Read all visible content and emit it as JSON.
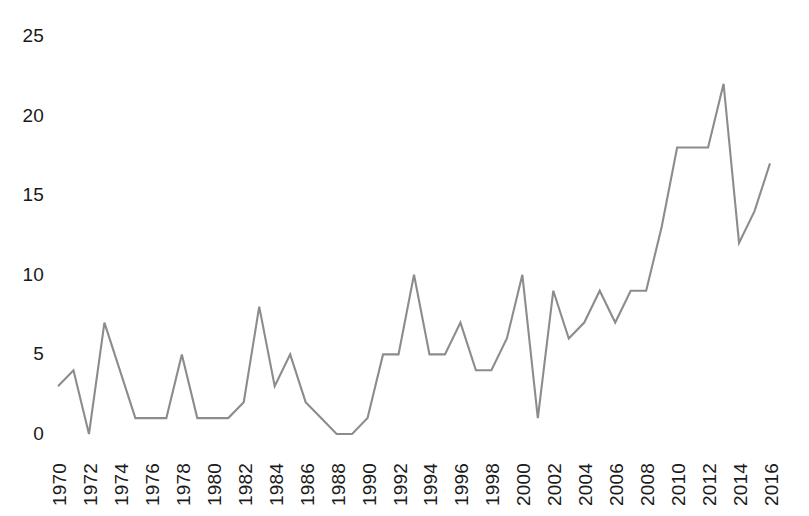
{
  "chart_data": {
    "type": "line",
    "title": "",
    "subtitle": "",
    "xlabel": "",
    "ylabel": "",
    "grid": false,
    "legend": null,
    "line_color": "#8c8c8c",
    "x": [
      1970,
      1971,
      1972,
      1973,
      1974,
      1975,
      1976,
      1977,
      1978,
      1979,
      1980,
      1981,
      1982,
      1983,
      1984,
      1985,
      1986,
      1987,
      1988,
      1989,
      1990,
      1991,
      1992,
      1993,
      1994,
      1995,
      1996,
      1997,
      1998,
      1999,
      2000,
      2001,
      2002,
      2003,
      2004,
      2005,
      2006,
      2007,
      2008,
      2009,
      2010,
      2011,
      2012,
      2013,
      2014,
      2015,
      2016
    ],
    "values": [
      3,
      4,
      0,
      7,
      4,
      1,
      1,
      1,
      5,
      1,
      1,
      1,
      2,
      8,
      3,
      5,
      2,
      1,
      0,
      0,
      1,
      5,
      5,
      10,
      5,
      5,
      7,
      4,
      4,
      6,
      10,
      1,
      9,
      6,
      7,
      9,
      7,
      9,
      9,
      13,
      18,
      18,
      18,
      22,
      12,
      14,
      17
    ],
    "xlim": [
      1970,
      2016
    ],
    "ylim": [
      0,
      25
    ],
    "yticks": [
      "0",
      "5",
      "10",
      "15",
      "20",
      "25"
    ],
    "ytick_values": [
      0,
      5,
      10,
      15,
      20,
      25
    ],
    "xticks": [
      "1970",
      "1972",
      "1974",
      "1976",
      "1978",
      "1980",
      "1982",
      "1984",
      "1986",
      "1988",
      "1990",
      "1992",
      "1994",
      "1996",
      "1998",
      "2000",
      "2002",
      "2004",
      "2006",
      "2008",
      "2010",
      "2012",
      "2014",
      "2016"
    ],
    "xtick_values": [
      1970,
      1972,
      1974,
      1976,
      1978,
      1980,
      1982,
      1984,
      1986,
      1988,
      1990,
      1992,
      1994,
      1996,
      1998,
      2000,
      2002,
      2004,
      2006,
      2008,
      2010,
      2012,
      2014,
      2016
    ],
    "axis_color": "#1a1a1a",
    "background": "#ffffff"
  }
}
